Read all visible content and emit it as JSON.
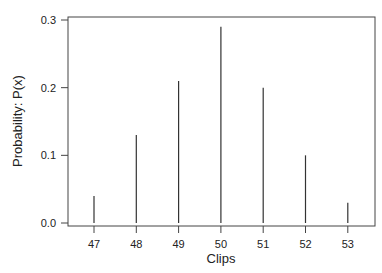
{
  "chart_data": {
    "type": "bar",
    "style": "spike",
    "title": "",
    "xlabel": "Clips",
    "ylabel": "Probability:  P(x)",
    "categories": [
      "47",
      "48",
      "49",
      "50",
      "51",
      "52",
      "53"
    ],
    "values": [
      0.04,
      0.13,
      0.21,
      0.29,
      0.2,
      0.1,
      0.03
    ],
    "ylim": [
      0,
      0.3
    ],
    "yticks": [
      "0.0",
      "0.1",
      "0.2",
      "0.3"
    ],
    "grid": false,
    "legend": null,
    "colors": {
      "line": "#333333",
      "axis": "#444444"
    }
  }
}
